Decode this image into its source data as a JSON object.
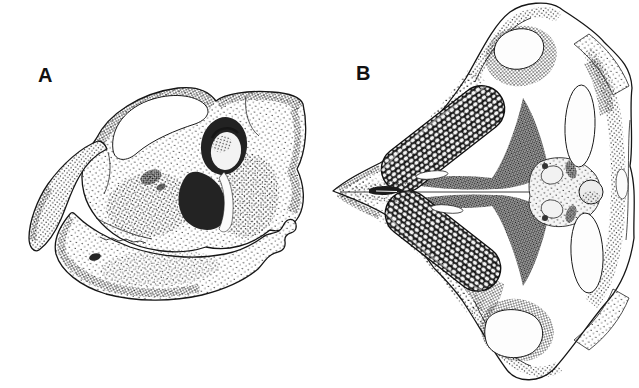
{
  "figure": {
    "background_color": "#ffffff",
    "ink_color": "#111111",
    "panels": {
      "a": {
        "label": "A",
        "alt": "Skull in left lateral view, stippled pen-and-ink scientific illustration"
      },
      "b": {
        "label": "B",
        "alt": "Skull in ventral palatal view with paired pebbled crushing tooth plates, stippled pen-and-ink scientific illustration"
      }
    }
  }
}
